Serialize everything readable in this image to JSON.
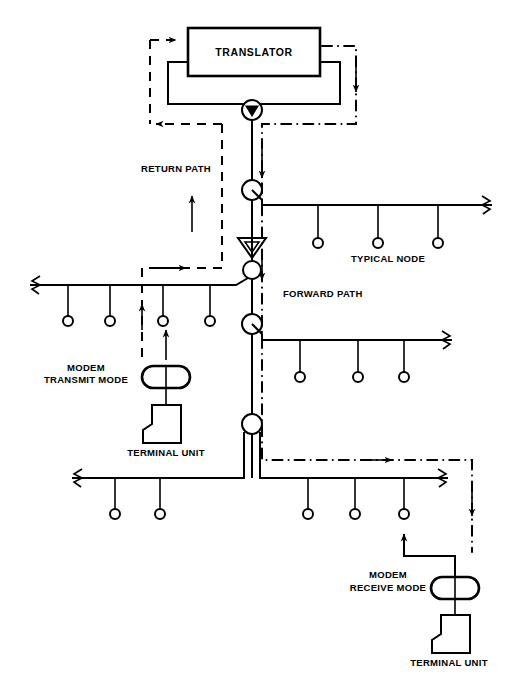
{
  "diagram": {
    "title_block": {
      "label": "TRANSLATOR"
    },
    "labels": [
      {
        "id": "return-path",
        "text": "RETURN PATH",
        "x": 141,
        "y": 172
      },
      {
        "id": "forward-path",
        "text": "FORWARD PATH",
        "x": 283,
        "y": 297
      },
      {
        "id": "typical-node",
        "text": "TYPICAL NODE",
        "x": 388,
        "y": 262
      },
      {
        "id": "modem-transmit-mode-line1",
        "text": "MODEM",
        "x": 86,
        "y": 371
      },
      {
        "id": "modem-transmit-mode-line2",
        "text": "TRANSMIT MODE",
        "x": 86,
        "y": 383
      },
      {
        "id": "terminal-unit-left",
        "text": "TERMINAL UNIT",
        "x": 166,
        "y": 454
      },
      {
        "id": "modem-receive-mode-line1",
        "text": "MODEM",
        "x": 388,
        "y": 578
      },
      {
        "id": "modem-receive-mode-line2",
        "text": "RECEIVE MODE",
        "x": 388,
        "y": 591
      },
      {
        "id": "terminal-unit-right",
        "text": "TERMINAL UNIT",
        "x": 447,
        "y": 663
      }
    ],
    "components": {
      "translator_box": {
        "x": 188,
        "y": 28,
        "width": 132,
        "height": 48
      },
      "headend_combiner": {
        "cx": 252,
        "cy": 110,
        "r": 10
      },
      "trunk_amplifier_1": {
        "cx": 252,
        "cy": 190,
        "r": 10
      },
      "bridger_amplifier": {
        "cx": 252,
        "cy": 248
      },
      "trunk_amplifier_2": {
        "cx": 252,
        "cy": 270,
        "r": 9
      },
      "trunk_amplifier_3": {
        "cx": 252,
        "cy": 324,
        "r": 10
      },
      "trunk_amplifier_4": {
        "cx": 252,
        "cy": 424,
        "r": 10
      },
      "modem_transmit": {
        "cx": 166,
        "cy": 377,
        "rx": 24,
        "ry": 11
      },
      "modem_receive": {
        "cx": 455,
        "cy": 588,
        "rx": 24,
        "ry": 11
      },
      "terminal_left": {
        "x": 148,
        "y": 405
      },
      "terminal_right": {
        "x": 437,
        "y": 615
      }
    },
    "paths": {
      "forward_path_style": "dash-dot",
      "return_path_style": "dashed",
      "cable_style": "solid"
    },
    "colors": {
      "line": "#000000",
      "background": "#ffffff",
      "fill": "#ffffff"
    },
    "trunk_lines": [
      {
        "id": "trunk-node-1",
        "y": 205,
        "x_start": 262,
        "x_end": 492,
        "taps": [
          318,
          378,
          438
        ]
      },
      {
        "id": "trunk-node-2",
        "y": 340,
        "x_start": 262,
        "x_end": 452,
        "taps": [
          300,
          358,
          404
        ]
      },
      {
        "id": "trunk-node-3",
        "y": 285,
        "x_start": 30,
        "x_end": 248,
        "taps": [
          68,
          110,
          163,
          210
        ]
      },
      {
        "id": "trunk-node-4",
        "y": 478,
        "x_start": 72,
        "x_end": 248,
        "taps": [
          115,
          160
        ]
      },
      {
        "id": "trunk-node-5",
        "y": 478,
        "x_start": 256,
        "x_end": 448,
        "taps": [
          308,
          355,
          404
        ]
      }
    ]
  }
}
